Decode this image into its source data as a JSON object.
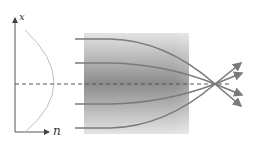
{
  "diagram": {
    "axis_labels": {
      "vertical": "x",
      "horizontal": "n"
    },
    "profile": "parabolic refractive-index profile n(x), maximum on optical axis",
    "medium": {
      "description": "gradient-index slab, darker (higher index) near axis",
      "x_start": 84,
      "x_end": 189,
      "y_top": 33,
      "y_bottom": 134
    },
    "optical_axis_y": 84,
    "focal_point": {
      "x": 215,
      "y": 84
    },
    "rays": [
      {
        "y_in": 39,
        "label": "ray-1"
      },
      {
        "y_in": 63,
        "label": "ray-2"
      },
      {
        "y_in": 104,
        "label": "ray-3"
      },
      {
        "y_in": 128,
        "label": "ray-4"
      }
    ],
    "colors": {
      "ray": "#7a7a7a",
      "axis": "#555555",
      "profile": "#bdbdbd",
      "gradient_dark": "#8a8a8a",
      "gradient_light": "#e2e2e2"
    }
  }
}
